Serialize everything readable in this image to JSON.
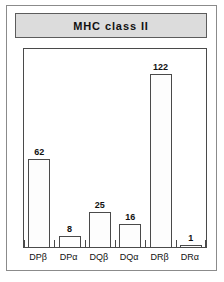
{
  "figure": {
    "title": "MHC class II"
  },
  "chart_data": {
    "type": "bar",
    "title": "MHC class II",
    "xlabel": "",
    "ylabel": "",
    "categories": [
      "DPβ",
      "DPα",
      "DQβ",
      "DQα",
      "DRβ",
      "DRα"
    ],
    "values": [
      62,
      8,
      25,
      16,
      122,
      1
    ],
    "value_labels": [
      "62",
      "8",
      "25",
      "16",
      "122",
      "1"
    ],
    "ylim": [
      0,
      140
    ],
    "grid": false,
    "legend": null,
    "bar_fill": "#fdfdfd",
    "bar_edge": "#4a4a4a",
    "axis_color": "#4a4a4a",
    "title_bar_color": "#dcdcdc",
    "background": "#ffffff"
  }
}
